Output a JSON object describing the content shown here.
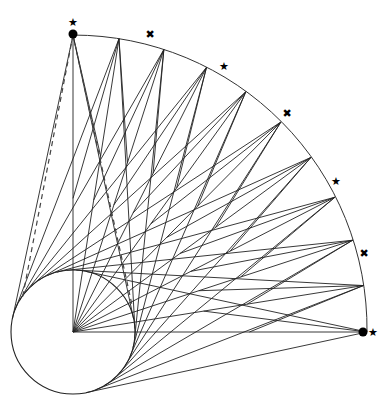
{
  "diagram": {
    "type": "geometric-construction",
    "center": [
      73,
      332
    ],
    "outer_radius": 294,
    "inner_circle": {
      "center": [
        73,
        332
      ],
      "radius": 62
    },
    "arc_start_deg": 90,
    "arc_end_deg": 0,
    "arc_points_count": 11,
    "endpoint_dots": [
      [
        73,
        34
      ],
      [
        363,
        332
      ]
    ],
    "star_markers": [
      {
        "pos": [
          73,
          23
        ],
        "glyph": "★"
      },
      {
        "pos": [
          150,
          35
        ],
        "glyph": "✖"
      },
      {
        "pos": [
          224,
          67
        ],
        "glyph": "★"
      },
      {
        "pos": [
          287,
          114
        ],
        "glyph": "✖"
      },
      {
        "pos": [
          336,
          182
        ],
        "glyph": "★"
      },
      {
        "pos": [
          364,
          254
        ],
        "glyph": "✖"
      },
      {
        "pos": [
          373,
          333
        ],
        "glyph": "★"
      }
    ],
    "dashed_lines_from_top_point": true,
    "colors": {
      "line": "#222222",
      "background": "#ffffff"
    }
  }
}
